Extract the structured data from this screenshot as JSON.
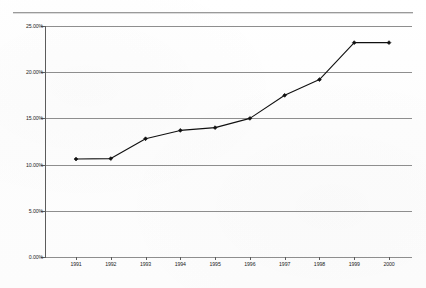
{
  "chart_data": {
    "type": "line",
    "title": "",
    "subtitle": "",
    "xlabel": "",
    "ylabel": "",
    "categories": [
      "1991",
      "1992",
      "1993",
      "1994",
      "1995",
      "1996",
      "1997",
      "1998",
      "1999",
      "2000"
    ],
    "x": [
      1991,
      1992,
      1993,
      1994,
      1995,
      1996,
      1997,
      1998,
      1999,
      2000
    ],
    "values": [
      10.6,
      10.65,
      12.8,
      13.7,
      14.0,
      15.0,
      17.5,
      19.2,
      23.2,
      23.2
    ],
    "series": [
      {
        "name": "",
        "values": [
          10.6,
          10.65,
          12.8,
          13.7,
          14.0,
          15.0,
          17.5,
          19.2,
          23.2,
          23.2
        ],
        "color": "#101010",
        "marker": "diamond"
      }
    ],
    "ylim": [
      0,
      25
    ],
    "y_ticks": [
      0,
      5,
      10,
      15,
      20,
      25
    ],
    "y_tick_labels": [
      "0.00%",
      "5.00%",
      "10.00%",
      "15.00%",
      "20.00%",
      "25.00%"
    ],
    "x_tick_labels": [
      "1991",
      "1992",
      "1993",
      "1994",
      "1995",
      "1996",
      "1997",
      "1998",
      "1999",
      "2000"
    ],
    "grid": {
      "horizontal": true,
      "vertical": false,
      "color": "#8e8e8e"
    },
    "legend": {
      "visible": false,
      "position": "none",
      "entries": []
    },
    "annotations": [],
    "axis_color": "#5c5c5c",
    "background_color": "#fdfdfd"
  },
  "decoration": {
    "top_rule_color": "#9a9a9a"
  }
}
